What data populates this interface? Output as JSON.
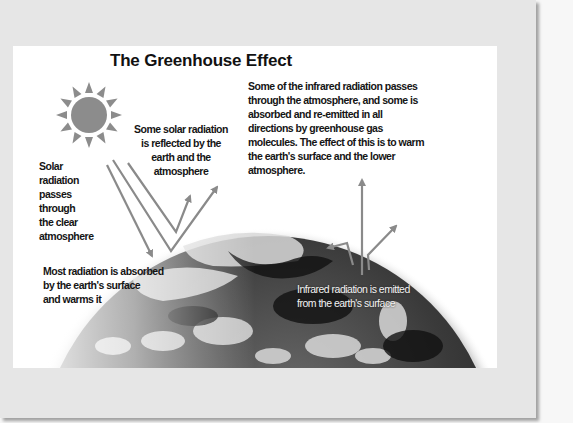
{
  "slide": {
    "title": "The Greenhouse Effect",
    "labels": {
      "reflected": "Some solar radiation\nis reflected by the\nearth and the\natmosphere",
      "passes": "Solar\nradiation\npasses\nthrough\nthe clear\natmosphere",
      "infrared_trapped": "Some of the infrared radiation passes\nthrough the atmosphere, and some is\nabsorbed and re-emitted in all\ndirections by greenhouse gas\nmolecules. The effect of this is to warm\nthe earth's surface and the lower\natmosphere.",
      "absorbed": "Most radiation is absorbed\nby the earth's surface\nand warms it",
      "emitted": "Infrared radiation is emitted\nfrom the earth's surface"
    },
    "icons": {
      "sun": "sun-icon",
      "earth": "earth-image"
    },
    "colors": {
      "arrow": "#8a8a8a",
      "sun": "#8c8c8c",
      "card_bg": "#e6e6e6",
      "slide_bg": "#ffffff"
    }
  }
}
